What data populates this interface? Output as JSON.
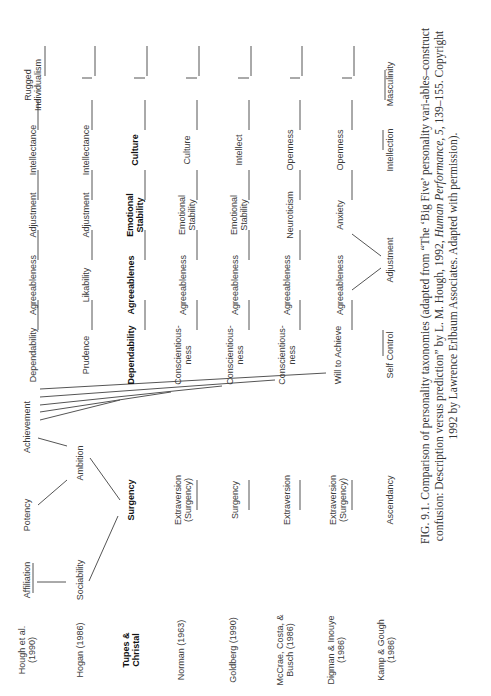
{
  "figure": {
    "orientation": "rotated-90-ccw",
    "rows": [
      {
        "source": "Hough et al. (1990)",
        "source_lines": [
          "Hough et al.",
          "(1990)"
        ],
        "bold": false,
        "traits": [
          "Affiliation",
          "Potency",
          "Achievement",
          "Dependability",
          "Agreeableness",
          "Adjustment",
          "Intellectance",
          "Rugged Individualism"
        ]
      },
      {
        "source": "Hogan (1986)",
        "source_lines": [
          "Hogan (1986)"
        ],
        "bold": false,
        "traits": [
          "Sociability",
          "Ambition",
          "Prudence",
          "Likability",
          "Adjustment",
          "Intellectance"
        ]
      },
      {
        "source": "Tupes & Christal",
        "source_lines": [
          "Tupes &",
          "Christal"
        ],
        "bold": true,
        "traits": [
          "Surgency",
          "Dependability",
          "Agreeablenes",
          "Emotional Stability",
          "Culture"
        ]
      },
      {
        "source": "Norman (1963)",
        "source_lines": [
          "Norman (1963)"
        ],
        "bold": false,
        "traits": [
          "Extraversion (Surgency)",
          "Conscientious-ness",
          "Agreeableness",
          "Emotional Stability",
          "Culture"
        ]
      },
      {
        "source": "Goldberg (1990)",
        "source_lines": [
          "Goldberg (1990)"
        ],
        "bold": false,
        "traits": [
          "Surgency",
          "Conscientious-ness",
          "Agreeableness",
          "Emotional Stability",
          "Intellect"
        ]
      },
      {
        "source": "McCrae, Costa, & Busch (1986)",
        "source_lines": [
          "McCrae, Costa, &",
          "Busch (1986)"
        ],
        "bold": false,
        "traits": [
          "Extraversion",
          "Conscientious-ness",
          "Agreeableness",
          "Neuroticism",
          "Openness"
        ]
      },
      {
        "source": "Digman & Inouye (1986)",
        "source_lines": [
          "Digman & Inouye",
          "(1986)"
        ],
        "bold": false,
        "traits": [
          "Extraversion (Surgency)",
          "Will to Achieve",
          "Agreeableness",
          "Anxiety",
          "Openness"
        ]
      },
      {
        "source": "Kamp & Gough (1986)",
        "source_lines": [
          "Kamp & Gough",
          "(1986)"
        ],
        "bold": false,
        "traits": [
          "Ascendancy",
          "Self Control",
          "Adjustment",
          "Intellection",
          "Masculinity"
        ]
      }
    ],
    "labels": {
      "hough_source": [
        "Hough et al.",
        "(1990)"
      ],
      "hogan_source": "Hogan (1986)",
      "tupes_source": [
        "Tupes &",
        "Christal"
      ],
      "norman_source": "Norman (1963)",
      "goldberg_source": "Goldberg (1990)",
      "mccrae_source": [
        "McCrae, Costa, &",
        "Busch (1986)"
      ],
      "digman_source": [
        "Digman & Inouye",
        "(1986)"
      ],
      "kamp_source": [
        "Kamp & Gough",
        "(1986)"
      ],
      "affiliation": "Affiliation",
      "potency": "Potency",
      "achievement": "Achievement",
      "hough_dependability": "Dependability",
      "hough_agreeableness": "Agreeableness",
      "hough_adjustment": "Adjustment",
      "hough_intellectance": "Intellectance",
      "rugged": [
        "Rugged",
        "Individualism"
      ],
      "sociability": "Sociability",
      "ambition": "Ambition",
      "prudence": "Prudence",
      "likability": "Likability",
      "hogan_adjustment": "Adjustment",
      "hogan_intellectance": "Intellectance",
      "tupes_surgency": "Surgency",
      "tupes_dependability": "Dependability",
      "tupes_agreeableness": "Agreeablenes",
      "tupes_emotional": [
        "Emotional",
        "Stability"
      ],
      "tupes_culture": "Culture",
      "norman_extraversion": [
        "Extraversion",
        "(Surgency)"
      ],
      "norman_conscientiousness": [
        "Conscientious-",
        "ness"
      ],
      "norman_agreeableness": "Agreeableness",
      "norman_emotional": [
        "Emotional",
        "Stability"
      ],
      "norman_culture": "Culture",
      "goldberg_surgency": "Surgency",
      "goldberg_conscientiousness": [
        "Conscientious-",
        "ness"
      ],
      "goldberg_agreeableness": "Agreeableness",
      "goldberg_emotional": [
        "Emotional",
        "Stability"
      ],
      "goldberg_intellect": "Intellect",
      "mccrae_extraversion": "Extraversion",
      "mccrae_conscientiousness": [
        "Conscientious-",
        "ness"
      ],
      "mccrae_agreeableness": "Agreeableness",
      "mccrae_neuroticism": "Neuroticism",
      "mccrae_openness": "Openness",
      "digman_extraversion": [
        "Extraversion",
        "(Surgency)"
      ],
      "digman_will": "Will to Achieve",
      "digman_agreeableness": "Agreeableness",
      "digman_anxiety": "Anxiety",
      "digman_openness": "Openness",
      "kamp_ascendancy": "Ascendancy",
      "kamp_selfcontrol": "Self Control",
      "kamp_adjustment": "Adjustment",
      "kamp_intellection": "Intellection",
      "kamp_masculinity": "Masculinity"
    },
    "caption": {
      "part1": "FIG. 9.1.  Comparison of personality taxonomies (adapted from “The ‘Big Five’ personality vari-ables–construct confusion: Description versus prediction” by L. M. Hough, 1992, ",
      "journal": "Human Performance,",
      "volume": "5,",
      "part2": " 139–155. Copyright 1992 by Lawrence Erlbaum Associates. Adapted with permission)."
    }
  }
}
